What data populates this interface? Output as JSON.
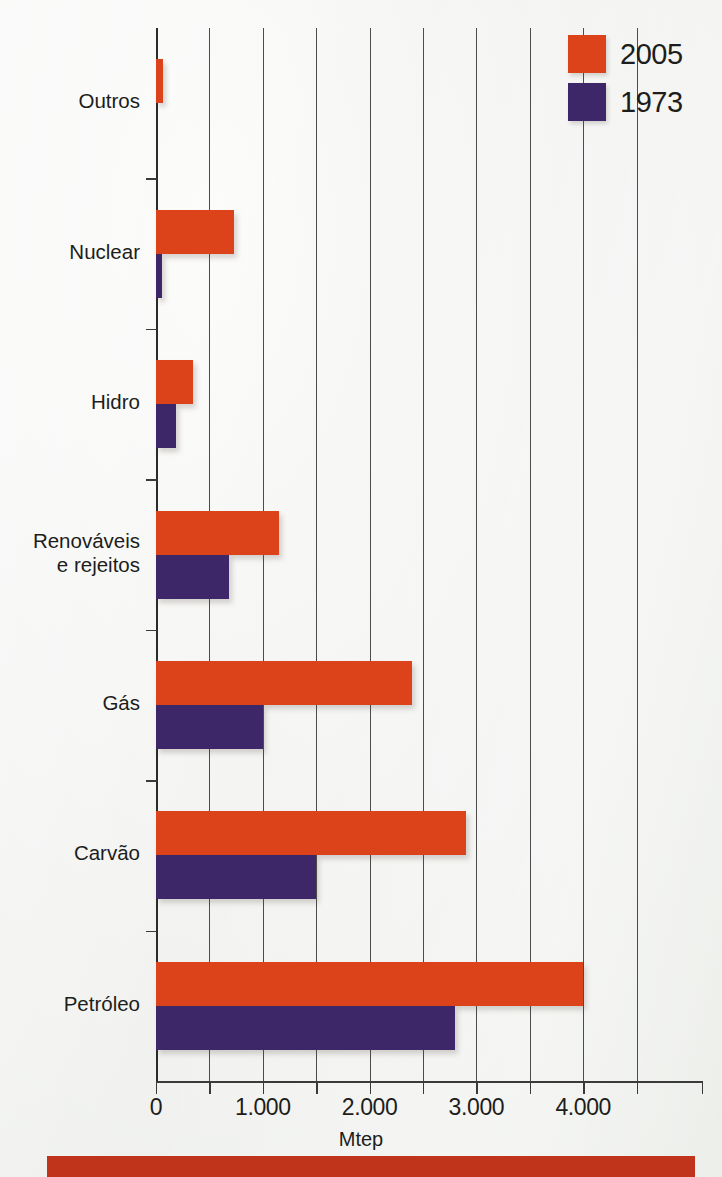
{
  "chart_data": {
    "type": "bar",
    "orientation": "horizontal",
    "title": "",
    "xlabel": "Mtep",
    "ylabel": "",
    "xlim": [
      0,
      5000
    ],
    "xticks": [
      0,
      500,
      1000,
      1500,
      2000,
      2500,
      3000,
      3500,
      4000,
      4500
    ],
    "xtick_labels": [
      "0",
      "",
      "1.000",
      "",
      "2.000",
      "",
      "3.000",
      "",
      "4.000",
      ""
    ],
    "grid": "vertical",
    "legend_position": "top-right",
    "categories": [
      "Outros",
      "Nuclear",
      "Hidro",
      "Renováveis\ne rejeitos",
      "Gás",
      "Carvão",
      "Petróleo"
    ],
    "series": [
      {
        "name": "2005",
        "color": "#dc431a",
        "values": [
          70,
          730,
          350,
          1150,
          2400,
          2900,
          4000
        ]
      },
      {
        "name": "1973",
        "color": "#3d2768",
        "values": [
          0,
          60,
          190,
          680,
          1000,
          1500,
          2800
        ]
      }
    ]
  },
  "axis": {
    "x_title": "Mtep",
    "tick_labels": [
      {
        "value": 0,
        "text": "0"
      },
      {
        "value": 1000,
        "text": "1.000"
      },
      {
        "value": 2000,
        "text": "2.000"
      },
      {
        "value": 3000,
        "text": "3.000"
      },
      {
        "value": 4000,
        "text": "4.000"
      }
    ]
  },
  "legend": {
    "items": [
      {
        "label": "2005",
        "color": "#dc431a"
      },
      {
        "label": "1973",
        "color": "#3d2768"
      }
    ]
  },
  "caption": {
    "text": ""
  },
  "colors": {
    "series_2005": "#dc431a",
    "series_1973": "#3d2768",
    "gridline": "#4c4c4c",
    "background": "#f2f3f1",
    "caption_band": "#c0341c",
    "text": "#1d1d1b"
  }
}
